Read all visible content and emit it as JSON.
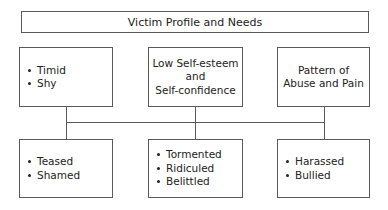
{
  "diagram": {
    "title": "Victim Profile and Needs",
    "top_row": [
      {
        "type": "bullets",
        "items": [
          "Timid",
          "Shy"
        ]
      },
      {
        "type": "text",
        "lines": [
          "Low Self-esteem",
          "and",
          "Self-confidence"
        ]
      },
      {
        "type": "text",
        "lines": [
          "Pattern of",
          "Abuse and Pain"
        ]
      }
    ],
    "bottom_row": [
      {
        "type": "bullets",
        "items": [
          "Teased",
          "Shamed"
        ]
      },
      {
        "type": "bullets",
        "items": [
          "Tormented",
          "Ridiculed",
          "Belittled"
        ]
      },
      {
        "type": "bullets",
        "items": [
          "Harassed",
          "Bullied"
        ]
      }
    ],
    "colors": {
      "line": "#5a5a5a",
      "text": "#222222",
      "background": "#ffffff"
    }
  }
}
